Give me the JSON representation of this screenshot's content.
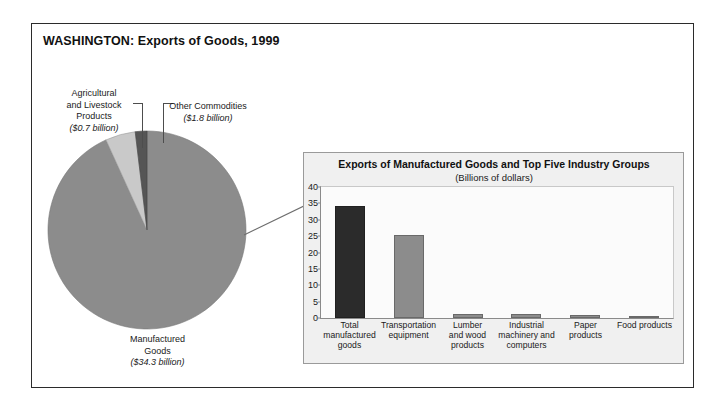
{
  "figure": {
    "title": "WASHINGTON: Exports of Goods, 1999"
  },
  "pie": {
    "labels": {
      "agricultural": {
        "name": "Agricultural\nand Livestock\nProducts",
        "name_line1": "Agricultural",
        "name_line2": "and Livestock",
        "name_line3": "Products",
        "amount": "($0.7 billion)"
      },
      "other": {
        "name_line1": "Other Commodities",
        "amount": "($1.8 billion)"
      },
      "manufactured": {
        "name_line1": "Manufactured",
        "name_line2": "Goods",
        "amount": "($34.3 billion)"
      }
    }
  },
  "bar_panel": {
    "title": "Exports of Manufactured Goods and Top Five Industry Groups",
    "subtitle": "(Billions of dollars)"
  },
  "chart_data": [
    {
      "type": "pie",
      "title": "WASHINGTON: Exports of Goods, 1999",
      "unit": "billions of dollars",
      "labels": [
        "Manufactured Goods",
        "Other Commodities",
        "Agricultural and Livestock Products"
      ],
      "values": [
        34.3,
        1.8,
        0.7
      ],
      "percents": [
        93.2,
        4.9,
        1.9
      ],
      "total": 36.8,
      "colors": [
        "#8c8c8c",
        "#c9c9c9",
        "#555555"
      ],
      "legend": "callout-labels",
      "start_angle_deg": 90,
      "direction": "clockwise-from-top-minor-wedges-left"
    },
    {
      "type": "bar",
      "title": "Exports of Manufactured Goods and Top Five Industry Groups",
      "subtitle": "(Billions of dollars)",
      "xlabel": "",
      "ylabel": "",
      "categories": [
        "Total manufactured goods",
        "Transportation equipment",
        "Lumber and wood products",
        "Industrial machinery and computers",
        "Paper products",
        "Food products"
      ],
      "category_lines": [
        [
          "Total",
          "manufactured",
          "goods"
        ],
        [
          "Transportation",
          "equipment"
        ],
        [
          "Lumber",
          "and wood",
          "products"
        ],
        [
          "Industrial",
          "machinery and",
          "computers"
        ],
        [
          "Paper products"
        ],
        [
          "Food products"
        ]
      ],
      "values": [
        34.3,
        25.4,
        1.2,
        1.1,
        0.9,
        0.7
      ],
      "bar_colors": [
        "#2b2b2b",
        "#8c8c8c",
        "#8c8c8c",
        "#8c8c8c",
        "#8c8c8c",
        "#8c8c8c"
      ],
      "ylim": [
        0,
        40
      ],
      "yticks": [
        0,
        5,
        10,
        15,
        20,
        25,
        30,
        35,
        40
      ],
      "grid": false,
      "legend": "none"
    }
  ],
  "yticks_text": [
    "40",
    "35",
    "30",
    "25",
    "20",
    "15",
    "10",
    "5",
    "0"
  ]
}
